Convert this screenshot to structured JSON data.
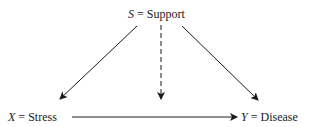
{
  "diagram": {
    "nodes": {
      "support": {
        "var": "S",
        "eq": "=",
        "label": "Support"
      },
      "stress": {
        "var": "X",
        "eq": "=",
        "label": "Stress"
      },
      "disease": {
        "var": "Y",
        "eq": "=",
        "label": "Disease"
      }
    },
    "edges": [
      {
        "from": "S",
        "to": "X",
        "style": "solid"
      },
      {
        "from": "S",
        "to": "X→Y edge",
        "style": "dashed"
      },
      {
        "from": "S",
        "to": "Y",
        "style": "solid"
      },
      {
        "from": "X",
        "to": "Y",
        "style": "solid"
      }
    ]
  }
}
